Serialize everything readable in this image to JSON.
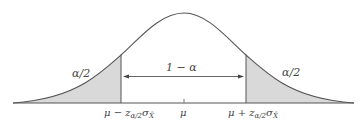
{
  "diagram": {
    "type": "normal-distribution-confidence-interval",
    "colors": {
      "curve": "#555555",
      "shade": "#d9d9d9",
      "axis": "#555555",
      "text": "#444444"
    },
    "labels": {
      "left_tail": "α/2",
      "right_tail": "α/2",
      "center_interval": "1 − α",
      "mu": "μ",
      "left_bound": {
        "prefix": "μ − z",
        "sub": "α/2",
        "sigma": "σ",
        "sigma_sub": "X̄"
      },
      "right_bound": {
        "prefix": "μ + z",
        "sub": "α/2",
        "sigma": "σ",
        "sigma_sub": "X̄"
      }
    }
  }
}
